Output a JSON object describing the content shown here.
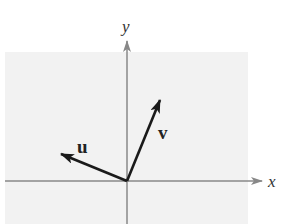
{
  "figure": {
    "axes": {
      "x_label": "x",
      "y_label": "y"
    },
    "vectors": [
      {
        "name": "u",
        "label": "u",
        "direction": "up-left"
      },
      {
        "name": "v",
        "label": "v",
        "direction": "up-right"
      }
    ],
    "colors": {
      "shade": "#f2f2f2",
      "axis": "#888888",
      "vector": "#1a1a1a"
    }
  }
}
